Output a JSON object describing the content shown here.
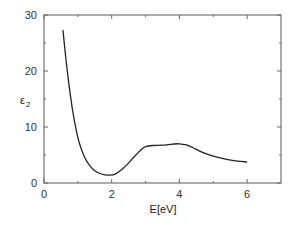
{
  "chart_data": {
    "type": "line",
    "title": "",
    "xlabel": "E[eV]",
    "ylabel": "ε₂",
    "xlim": [
      0,
      7
    ],
    "ylim": [
      0,
      30
    ],
    "xticks": [
      0,
      2,
      4,
      6
    ],
    "yticks": [
      0,
      10,
      20,
      30
    ],
    "x_minor_ticks": [
      1,
      3,
      5
    ],
    "y_minor_ticks": [
      5,
      15,
      25
    ],
    "grid": false,
    "legend": null,
    "series": [
      {
        "name": "epsilon_2",
        "color": "#222222",
        "x": [
          0.56,
          0.65,
          0.75,
          0.85,
          0.95,
          1.05,
          1.2,
          1.35,
          1.5,
          1.65,
          1.8,
          1.95,
          2.1,
          2.3,
          2.5,
          2.7,
          2.9,
          3.0,
          3.2,
          3.5,
          3.8,
          4.0,
          4.2,
          4.4,
          4.6,
          4.8,
          5.0,
          5.3,
          5.6,
          6.0
        ],
        "y": [
          27.3,
          22.0,
          17.0,
          12.8,
          9.5,
          7.0,
          4.6,
          3.1,
          2.2,
          1.7,
          1.45,
          1.4,
          1.6,
          2.4,
          3.6,
          4.9,
          6.1,
          6.5,
          6.7,
          6.75,
          6.95,
          7.0,
          6.8,
          6.3,
          5.7,
          5.2,
          4.8,
          4.35,
          4.0,
          3.75
        ]
      }
    ]
  },
  "labels": {
    "x_axis": "E[eV]",
    "y_axis_base": "ε",
    "y_axis_sub": "2",
    "x_ticks": [
      "0",
      "2",
      "4",
      "6"
    ],
    "y_ticks": [
      "0",
      "10",
      "20",
      "30"
    ]
  }
}
